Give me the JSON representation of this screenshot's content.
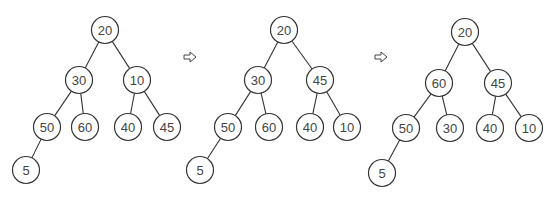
{
  "colors": {
    "stroke": "#333333",
    "text": "#444444",
    "background": "#ffffff"
  },
  "arrow_icon": "right-outline-arrow",
  "trees": [
    {
      "name": "tree-step-1",
      "nodes": [
        {
          "id": "a",
          "value": "20"
        },
        {
          "id": "b",
          "value": "30"
        },
        {
          "id": "c",
          "value": "10"
        },
        {
          "id": "d",
          "value": "50"
        },
        {
          "id": "e",
          "value": "60"
        },
        {
          "id": "f",
          "value": "40"
        },
        {
          "id": "g",
          "value": "45"
        },
        {
          "id": "h",
          "value": "5"
        }
      ],
      "edges": [
        [
          "a",
          "b"
        ],
        [
          "a",
          "c"
        ],
        [
          "b",
          "d"
        ],
        [
          "b",
          "e"
        ],
        [
          "c",
          "f"
        ],
        [
          "c",
          "g"
        ],
        [
          "d",
          "h"
        ]
      ]
    },
    {
      "name": "tree-step-2",
      "nodes": [
        {
          "id": "a",
          "value": "20"
        },
        {
          "id": "b",
          "value": "30"
        },
        {
          "id": "c",
          "value": "45"
        },
        {
          "id": "d",
          "value": "50"
        },
        {
          "id": "e",
          "value": "60"
        },
        {
          "id": "f",
          "value": "40"
        },
        {
          "id": "g",
          "value": "10"
        },
        {
          "id": "h",
          "value": "5"
        }
      ],
      "edges": [
        [
          "a",
          "b"
        ],
        [
          "a",
          "c"
        ],
        [
          "b",
          "d"
        ],
        [
          "b",
          "e"
        ],
        [
          "c",
          "f"
        ],
        [
          "c",
          "g"
        ],
        [
          "d",
          "h"
        ]
      ]
    },
    {
      "name": "tree-step-3",
      "nodes": [
        {
          "id": "a",
          "value": "20"
        },
        {
          "id": "b",
          "value": "60"
        },
        {
          "id": "c",
          "value": "45"
        },
        {
          "id": "d",
          "value": "50"
        },
        {
          "id": "e",
          "value": "30"
        },
        {
          "id": "f",
          "value": "40"
        },
        {
          "id": "g",
          "value": "10"
        },
        {
          "id": "h",
          "value": "5"
        }
      ],
      "edges": [
        [
          "a",
          "b"
        ],
        [
          "a",
          "c"
        ],
        [
          "b",
          "d"
        ],
        [
          "b",
          "e"
        ],
        [
          "c",
          "f"
        ],
        [
          "c",
          "g"
        ],
        [
          "d",
          "h"
        ]
      ]
    }
  ]
}
